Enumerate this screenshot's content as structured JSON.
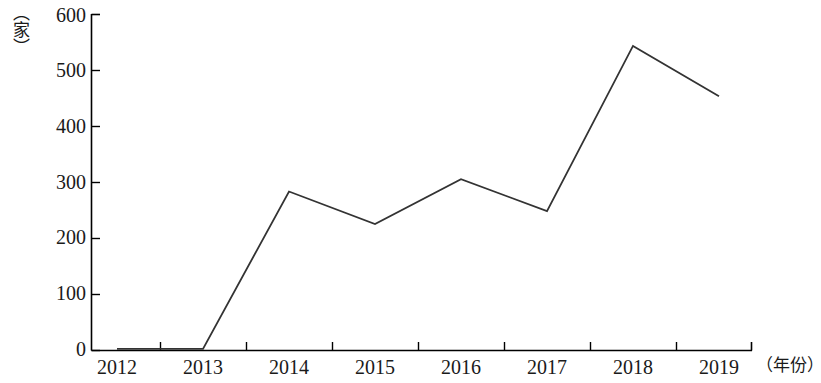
{
  "chart_data": {
    "type": "line",
    "title": "",
    "xlabel": "（年份）",
    "ylabel": "（家）",
    "categories": [
      "2012",
      "2013",
      "2014",
      "2015",
      "2016",
      "2017",
      "2018",
      "2019"
    ],
    "values": [
      2,
      2,
      283,
      225,
      305,
      248,
      543,
      453
    ],
    "series": [
      {
        "name": "",
        "values": [
          2,
          2,
          283,
          225,
          305,
          248,
          543,
          453
        ]
      }
    ],
    "ylim": [
      0,
      600
    ],
    "yticks": [
      "0",
      "100",
      "200",
      "300",
      "400",
      "500",
      "600"
    ],
    "ytick_values": [
      0,
      100,
      200,
      300,
      400,
      500,
      600
    ],
    "xticks": [
      "2012",
      "2013",
      "2014",
      "2015",
      "2016",
      "2017",
      "2018",
      "2019"
    ],
    "grid": false,
    "legend": false,
    "legend_position": "none",
    "line_color": "#333333",
    "axis_color": "#000000"
  },
  "axes": {
    "y_unit_label": "（家）",
    "x_unit_label": "（年份）"
  }
}
